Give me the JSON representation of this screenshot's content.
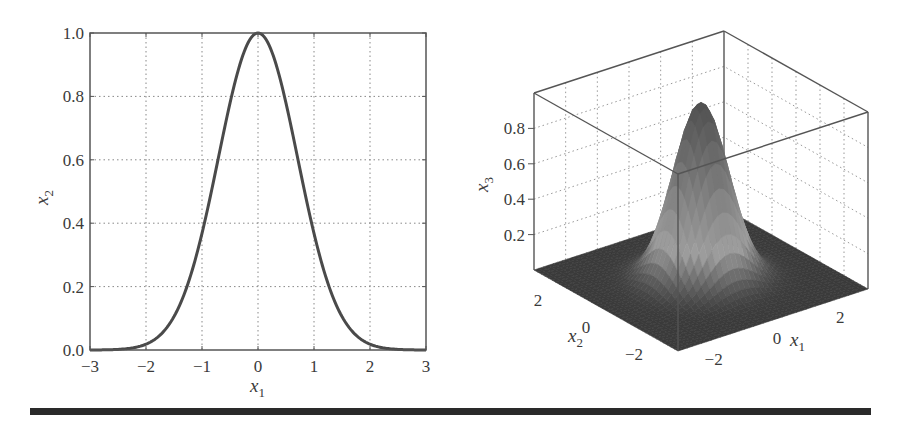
{
  "chart_data": [
    {
      "type": "line",
      "title": "",
      "xlabel": "x1",
      "ylabel": "x2",
      "xlim": [
        -3,
        3
      ],
      "ylim": [
        0,
        1
      ],
      "grid": true,
      "grid_style": "dotted",
      "x_ticks": [
        -3,
        -2,
        -1,
        0,
        1,
        2,
        3
      ],
      "x_tick_labels": [
        "−3",
        "−2",
        "−1",
        "0",
        "1",
        "2",
        "3"
      ],
      "y_ticks": [
        0,
        0.2,
        0.4,
        0.6,
        0.8,
        1.0
      ],
      "y_tick_labels": [
        "0.0",
        "0.2",
        "0.4",
        "0.6",
        "0.8",
        "1.0"
      ],
      "function": "x2 = exp(-x1^2)",
      "series": [
        {
          "name": "exp(-x1^2)",
          "x": [
            -3,
            -2.5,
            -2,
            -1.5,
            -1,
            -0.75,
            -0.5,
            -0.25,
            0,
            0.25,
            0.5,
            0.75,
            1,
            1.5,
            2,
            2.5,
            3
          ],
          "y": [
            0.0,
            0.002,
            0.018,
            0.105,
            0.368,
            0.57,
            0.779,
            0.939,
            1.0,
            0.939,
            0.779,
            0.57,
            0.368,
            0.105,
            0.018,
            0.002,
            0.0
          ]
        }
      ],
      "line_color": "#4a4a4a"
    },
    {
      "type": "surface",
      "title": "",
      "xlabel": "x1",
      "ylabel": "x2",
      "zlabel": "x3",
      "xlim": [
        -3,
        3
      ],
      "ylim": [
        -3,
        3
      ],
      "zlim": [
        0,
        1
      ],
      "function": "x3 = exp(-(x1^2 + x2^2))",
      "peak": 1.0,
      "x_ticks": [
        -2,
        0,
        2
      ],
      "x_tick_labels": [
        "−2",
        "0",
        "2"
      ],
      "y_ticks": [
        -2,
        0,
        2
      ],
      "y_tick_labels": [
        "−2",
        "0",
        "2"
      ],
      "z_ticks": [
        0.2,
        0.4,
        0.6,
        0.8
      ],
      "z_tick_labels": [
        "0.2",
        "0.4",
        "0.6",
        "0.8"
      ],
      "grid": true,
      "colormap": "grayscale",
      "floor_color": "#3a3a3a",
      "peak_color": "#505050",
      "mid_color": "#9a9a9a"
    }
  ],
  "labels": {
    "left_xlabel_main": "x",
    "left_xlabel_sub": "1",
    "left_ylabel_main": "x",
    "left_ylabel_sub": "2",
    "right_zlabel_main": "x",
    "right_zlabel_sub": "3",
    "right_x1label_main": "x",
    "right_x1label_sub": "1",
    "right_x2label_main": "x",
    "right_x2label_sub": "2"
  }
}
